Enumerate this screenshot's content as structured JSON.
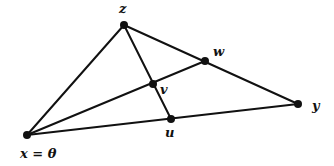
{
  "diagram": {
    "type": "geometric-figure",
    "points": [
      {
        "id": "x",
        "label": "x = θ",
        "cx": 27,
        "cy": 135,
        "lx": 20,
        "ly": 158
      },
      {
        "id": "y",
        "label": "y",
        "cx": 298,
        "cy": 104,
        "lx": 312,
        "ly": 110
      },
      {
        "id": "z",
        "label": "z",
        "cx": 124,
        "cy": 25,
        "lx": 119,
        "ly": 13
      },
      {
        "id": "w",
        "label": "w",
        "cx": 205,
        "cy": 61,
        "lx": 213,
        "ly": 56
      },
      {
        "id": "v",
        "label": "v",
        "cx": 153,
        "cy": 84,
        "lx": 160,
        "ly": 94
      },
      {
        "id": "u",
        "label": "u",
        "cx": 171,
        "cy": 119,
        "lx": 165,
        "ly": 137
      }
    ],
    "edges": [
      {
        "from": "x",
        "to": "z"
      },
      {
        "from": "z",
        "to": "y"
      },
      {
        "from": "x",
        "to": "y"
      },
      {
        "from": "x",
        "to": "w"
      },
      {
        "from": "z",
        "to": "u"
      }
    ],
    "colors": {
      "stroke": "#111111",
      "background": "#ffffff"
    }
  }
}
